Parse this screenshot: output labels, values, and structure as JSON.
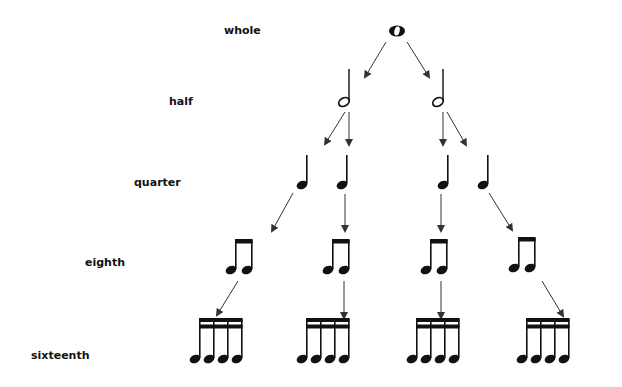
{
  "diagram": {
    "type": "note-value-tree",
    "levels": [
      {
        "name": "whole",
        "label": "whole",
        "count": 1
      },
      {
        "name": "half",
        "label": "half",
        "count": 2
      },
      {
        "name": "quarter",
        "label": "quarter",
        "count": 4
      },
      {
        "name": "eighth",
        "label": "eighth",
        "count": 8
      },
      {
        "name": "sixteenth",
        "label": "sixteenth",
        "count": 16
      }
    ],
    "colors": {
      "ink": "#111111",
      "arrow": "#333333",
      "background": "#ffffff"
    }
  }
}
